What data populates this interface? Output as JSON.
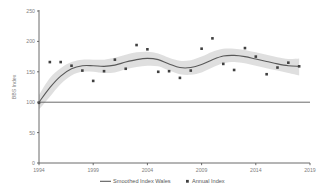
{
  "chart_data": {
    "type": "line",
    "title": "",
    "xlabel": "",
    "ylabel": "BBS Index",
    "xlim": [
      1994,
      2019
    ],
    "ylim": [
      0,
      250
    ],
    "grid": false,
    "legend_position": "bottom",
    "y_ticks": [
      0,
      50,
      100,
      150,
      200,
      250
    ],
    "x_ticks": [
      1994,
      1999,
      2004,
      2009,
      2014,
      2019
    ],
    "reference_line": {
      "value": 100,
      "label": ""
    },
    "series": [
      {
        "name": "Smoothed Index Wales",
        "type": "line",
        "x": [
          1994,
          1995,
          1996,
          1997,
          1998,
          1999,
          2000,
          2001,
          2002,
          2003,
          2004,
          2005,
          2006,
          2007,
          2008,
          2009,
          2010,
          2011,
          2012,
          2013,
          2014,
          2015,
          2016,
          2017,
          2018
        ],
        "values": [
          100,
          124,
          143,
          155,
          160,
          160,
          159,
          161,
          166,
          170,
          172,
          170,
          163,
          157,
          157,
          162,
          170,
          176,
          177,
          175,
          171,
          167,
          163,
          160,
          159
        ]
      },
      {
        "name": "Annual Index",
        "type": "scatter",
        "x": [
          1994,
          1995,
          1996,
          1997,
          1998,
          1999,
          2000,
          2001,
          2002,
          2003,
          2004,
          2005,
          2006,
          2007,
          2008,
          2009,
          2010,
          2011,
          2012,
          2013,
          2014,
          2015,
          2016,
          2017,
          2018
        ],
        "values": [
          99,
          166,
          166,
          160,
          152,
          135,
          151,
          170,
          155,
          194,
          187,
          150,
          151,
          140,
          152,
          188,
          205,
          163,
          153,
          189,
          175,
          146,
          157,
          165,
          159
        ]
      },
      {
        "name": "Confidence band",
        "type": "area",
        "x": [
          1994,
          1995,
          1996,
          1997,
          1998,
          1999,
          2000,
          2001,
          2002,
          2003,
          2004,
          2005,
          2006,
          2007,
          2008,
          2009,
          2010,
          2011,
          2012,
          2013,
          2014,
          2015,
          2016,
          2017,
          2018
        ],
        "upper": [
          112,
          140,
          156,
          166,
          170,
          170,
          170,
          173,
          178,
          182,
          183,
          180,
          173,
          168,
          169,
          175,
          183,
          188,
          188,
          186,
          182,
          178,
          174,
          171,
          172
        ],
        "lower": [
          88,
          109,
          130,
          144,
          150,
          150,
          148,
          149,
          154,
          158,
          160,
          159,
          152,
          146,
          145,
          149,
          157,
          164,
          166,
          164,
          160,
          156,
          152,
          148,
          144
        ]
      }
    ],
    "legend": [
      {
        "label": "Smoothed Index Wales",
        "marker": "line",
        "color": "#595959"
      },
      {
        "label": "Annual Index",
        "marker": "square",
        "color": "#404040"
      }
    ],
    "colors": {
      "line": "#595959",
      "band": "#d9d9d9",
      "points": "#404040",
      "axis": "#595959",
      "tick_text": "#808080"
    }
  }
}
